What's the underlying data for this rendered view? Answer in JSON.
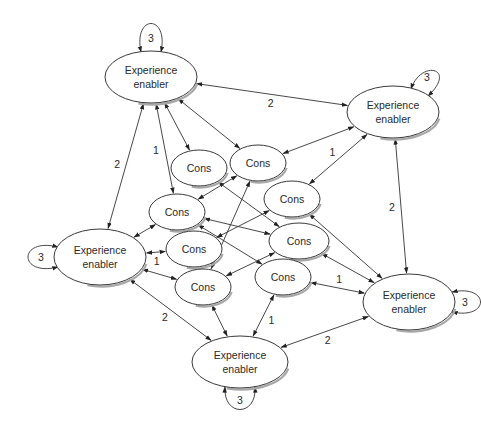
{
  "diagram": {
    "type": "network",
    "nodes": [
      {
        "id": "E1",
        "kind": "experience",
        "lines": [
          "Experience",
          "enabler"
        ],
        "cx": 151,
        "cy": 77,
        "rx": 46,
        "ry": 26
      },
      {
        "id": "E2",
        "kind": "experience",
        "lines": [
          "Experience",
          "enabler"
        ],
        "cx": 393,
        "cy": 112,
        "rx": 46,
        "ry": 26
      },
      {
        "id": "E3",
        "kind": "experience",
        "lines": [
          "Experience",
          "enabler"
        ],
        "cx": 100,
        "cy": 257,
        "rx": 46,
        "ry": 28
      },
      {
        "id": "E4",
        "kind": "experience",
        "lines": [
          "Experience",
          "enabler"
        ],
        "cx": 409,
        "cy": 302,
        "rx": 46,
        "ry": 28
      },
      {
        "id": "E5",
        "kind": "experience",
        "lines": [
          "Experience",
          "enabler"
        ],
        "cx": 240,
        "cy": 362,
        "rx": 48,
        "ry": 26
      },
      {
        "id": "C1",
        "kind": "cons",
        "lines": [
          "Cons"
        ],
        "cx": 199,
        "cy": 168,
        "rx": 28,
        "ry": 18
      },
      {
        "id": "C2",
        "kind": "cons",
        "lines": [
          "Cons"
        ],
        "cx": 258,
        "cy": 163,
        "rx": 28,
        "ry": 18
      },
      {
        "id": "C3",
        "kind": "cons",
        "lines": [
          "Cons"
        ],
        "cx": 177,
        "cy": 212,
        "rx": 28,
        "ry": 18
      },
      {
        "id": "C4",
        "kind": "cons",
        "lines": [
          "Cons"
        ],
        "cx": 292,
        "cy": 199,
        "rx": 28,
        "ry": 18
      },
      {
        "id": "C5",
        "kind": "cons",
        "lines": [
          "Cons"
        ],
        "cx": 194,
        "cy": 249,
        "rx": 28,
        "ry": 18
      },
      {
        "id": "C6",
        "kind": "cons",
        "lines": [
          "Cons"
        ],
        "cx": 299,
        "cy": 241,
        "rx": 30,
        "ry": 18
      },
      {
        "id": "C7",
        "kind": "cons",
        "lines": [
          "Cons"
        ],
        "cx": 203,
        "cy": 287,
        "rx": 28,
        "ry": 18
      },
      {
        "id": "C8",
        "kind": "cons",
        "lines": [
          "Cons"
        ],
        "cx": 283,
        "cy": 277,
        "rx": 28,
        "ry": 18
      }
    ],
    "self_loops": [
      {
        "node": "E1",
        "label": "3",
        "side": "top"
      },
      {
        "node": "E2",
        "label": "3",
        "side": "top-right"
      },
      {
        "node": "E3",
        "label": "3",
        "side": "left"
      },
      {
        "node": "E4",
        "label": "3",
        "side": "right"
      },
      {
        "node": "E5",
        "label": "3",
        "side": "bottom"
      }
    ],
    "edges": [
      {
        "from": "E1",
        "to": "E2",
        "label": "2",
        "dir": "both"
      },
      {
        "from": "E1",
        "to": "E3",
        "label": "2",
        "dir": "both"
      },
      {
        "from": "E2",
        "to": "E4",
        "label": "2",
        "dir": "both"
      },
      {
        "from": "E3",
        "to": "E5",
        "label": "2",
        "dir": "both"
      },
      {
        "from": "E5",
        "to": "E4",
        "label": "2",
        "dir": "both"
      },
      {
        "from": "E1",
        "to": "C3",
        "label": "1",
        "dir": "both"
      },
      {
        "from": "E1",
        "to": "C1",
        "label": "",
        "dir": "both"
      },
      {
        "from": "E1",
        "to": "C2",
        "label": "",
        "dir": "both"
      },
      {
        "from": "E2",
        "to": "C2",
        "label": "",
        "dir": "both"
      },
      {
        "from": "E2",
        "to": "C4",
        "label": "1",
        "dir": "both"
      },
      {
        "from": "E3",
        "to": "C3",
        "label": "",
        "dir": "both"
      },
      {
        "from": "E3",
        "to": "C5",
        "label": "1",
        "dir": "both"
      },
      {
        "from": "E3",
        "to": "C7",
        "label": "",
        "dir": "both"
      },
      {
        "from": "E4",
        "to": "C4",
        "label": "",
        "dir": "both"
      },
      {
        "from": "E4",
        "to": "C6",
        "label": "",
        "dir": "both"
      },
      {
        "from": "E4",
        "to": "C8",
        "label": "1",
        "dir": "both"
      },
      {
        "from": "E5",
        "to": "C7",
        "label": "",
        "dir": "both"
      },
      {
        "from": "E5",
        "to": "C8",
        "label": "1",
        "dir": "both"
      },
      {
        "from": "C1",
        "to": "C6",
        "label": "",
        "dir": "both"
      },
      {
        "from": "C3",
        "to": "C2",
        "label": "",
        "dir": "both"
      },
      {
        "from": "C3",
        "to": "C6",
        "label": "",
        "dir": "both"
      },
      {
        "from": "C3",
        "to": "C8",
        "label": "",
        "dir": "both"
      },
      {
        "from": "C5",
        "to": "C4",
        "label": "",
        "dir": "both"
      },
      {
        "from": "C7",
        "to": "C2",
        "label": "",
        "dir": "both"
      },
      {
        "from": "C7",
        "to": "C6",
        "label": "",
        "dir": "both"
      }
    ]
  }
}
